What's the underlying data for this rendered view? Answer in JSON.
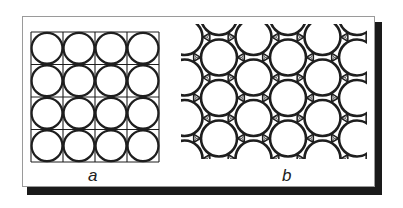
{
  "figure": {
    "panels": [
      {
        "id": "a",
        "label": "a",
        "arrangement": "square",
        "rows": 4,
        "cols": 4,
        "description": "Circles packed in a square grid, each circle inscribed in a grid cell"
      },
      {
        "id": "b",
        "label": "b",
        "arrangement": "hexagonal",
        "description": "Circles in hexagonal close packing with curvilinear triangular interstices"
      }
    ],
    "colors": {
      "stroke": "#1e1e1e",
      "frame_border": "#9a9a9a",
      "shadow": "#1a1a1a",
      "background": "#ffffff"
    }
  }
}
